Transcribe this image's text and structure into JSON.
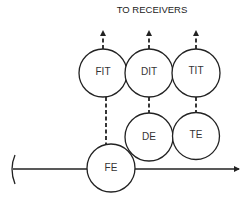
{
  "header": {
    "title": "TO RECEIVERS"
  },
  "nodes": [
    {
      "id": "FIT",
      "label": "FIT",
      "cx": 103,
      "cy": 73,
      "r": 24
    },
    {
      "id": "DIT",
      "label": "DIT",
      "cx": 149,
      "cy": 73,
      "r": 24
    },
    {
      "id": "TIT",
      "label": "TIT",
      "cx": 196,
      "cy": 73,
      "r": 24
    },
    {
      "id": "DE",
      "label": "DE",
      "cx": 149,
      "cy": 137,
      "r": 24
    },
    {
      "id": "TE",
      "label": "TE",
      "cx": 196,
      "cy": 137,
      "r": 24
    },
    {
      "id": "FE",
      "label": "FE",
      "cx": 111,
      "cy": 168,
      "r": 24
    }
  ],
  "edges": [
    {
      "from": "FIT",
      "to": "receivers",
      "style": "dashed-arrow"
    },
    {
      "from": "DIT",
      "to": "receivers",
      "style": "dashed-arrow"
    },
    {
      "from": "TIT",
      "to": "receivers",
      "style": "dashed-arrow"
    },
    {
      "from": "FE",
      "to": "FIT",
      "style": "dashed"
    },
    {
      "from": "DE",
      "to": "DIT",
      "style": "dashed"
    },
    {
      "from": "TE",
      "to": "TIT",
      "style": "dashed"
    },
    {
      "from": "input-bracket",
      "to": "FE",
      "style": "solid"
    },
    {
      "from": "FE",
      "to": "output",
      "style": "solid-arrow"
    }
  ],
  "colors": {
    "stroke": "#222222",
    "background": "#ffffff"
  }
}
